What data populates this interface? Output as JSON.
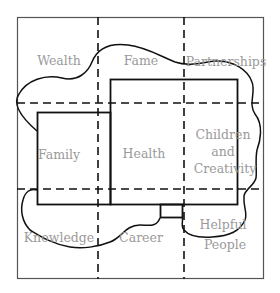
{
  "diagram": {
    "type": "bagua-map",
    "grid": {
      "rows": 3,
      "cols": 3
    },
    "regions": [
      {
        "id": "wealth",
        "lines": [
          "Wealth"
        ]
      },
      {
        "id": "fame",
        "lines": [
          "Fame"
        ]
      },
      {
        "id": "partnerships",
        "lines": [
          "Partnerships"
        ]
      },
      {
        "id": "family",
        "lines": [
          "Family"
        ]
      },
      {
        "id": "health",
        "lines": [
          "Health"
        ]
      },
      {
        "id": "children",
        "lines": [
          "Children",
          "and",
          "Creativity"
        ]
      },
      {
        "id": "knowledge",
        "lines": [
          "Knowledge"
        ]
      },
      {
        "id": "career",
        "lines": [
          "Career"
        ]
      },
      {
        "id": "helpful",
        "lines": [
          "Helpful",
          "People"
        ]
      }
    ],
    "colors": {
      "label": "#9a9a9a",
      "outline": "#1a1a1a",
      "frame": "#555555"
    }
  }
}
